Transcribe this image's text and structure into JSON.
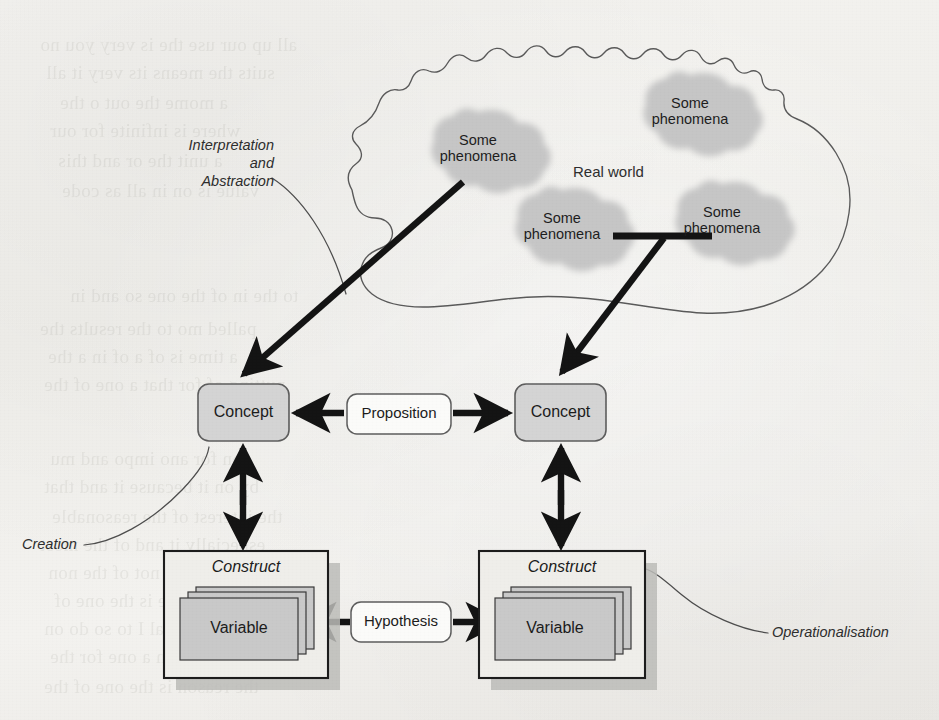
{
  "figure": {
    "kind": "conceptual-research-model-diagram",
    "real_world_label": "Real world",
    "phenomena_label": "Some\nphenomena",
    "phenomena": [
      {
        "id": "ph-top-right",
        "line1": "Some",
        "line2": "phenomena",
        "cx": 690,
        "cy": 113
      },
      {
        "id": "ph-left",
        "line1": "Some",
        "line2": "phenomena",
        "cx": 478,
        "cy": 150
      },
      {
        "id": "ph-bottom-left",
        "line1": "Some",
        "line2": "phenomena",
        "cx": 562,
        "cy": 228
      },
      {
        "id": "ph-bottom-right",
        "line1": "Some",
        "line2": "phenomena",
        "cx": 722,
        "cy": 222
      }
    ],
    "annotations": [
      {
        "id": "interpretation",
        "text": "Interpretation\nand\nAbstraction",
        "lines": [
          "Interpretation",
          "and",
          "Abstraction"
        ]
      },
      {
        "id": "creation",
        "text": "Creation"
      },
      {
        "id": "operationalisation",
        "text": "Operationalisation"
      }
    ],
    "nodes": [
      {
        "id": "concept-left",
        "label": "Concept",
        "type": "rounded-box",
        "x": 198,
        "y": 384,
        "w": 91,
        "h": 57
      },
      {
        "id": "concept-right",
        "label": "Concept",
        "type": "rounded-box",
        "x": 515,
        "y": 384,
        "w": 91,
        "h": 57
      },
      {
        "id": "proposition",
        "label": "Proposition",
        "type": "rounded-box-white",
        "x": 347,
        "y": 394,
        "w": 103,
        "h": 40
      },
      {
        "id": "construct-left",
        "label": "Construct",
        "type": "square-box",
        "x": 164,
        "y": 551,
        "w": 164,
        "h": 127
      },
      {
        "id": "construct-right",
        "label": "Construct",
        "type": "square-box",
        "x": 479,
        "y": 551,
        "w": 166,
        "h": 127
      },
      {
        "id": "variable-left",
        "label": "Variable",
        "type": "stacked-card",
        "x": 180,
        "y": 596,
        "w": 118,
        "h": 62
      },
      {
        "id": "variable-right",
        "label": "Variable",
        "type": "stacked-card",
        "x": 495,
        "y": 596,
        "w": 120,
        "h": 62
      },
      {
        "id": "hypothesis",
        "label": "Hypothesis",
        "type": "rounded-box-white",
        "x": 352,
        "y": 602,
        "w": 98,
        "h": 40
      }
    ],
    "edges": [
      {
        "id": "edge-phenomena-to-concept-left",
        "from": "ph-left",
        "to": "concept-left",
        "style": "thick-arrow",
        "direction": "one-way"
      },
      {
        "id": "edge-phenomena-to-concept-right",
        "from": "ph-bottom-right",
        "to": "concept-right",
        "style": "thick-arrow",
        "direction": "one-way"
      },
      {
        "id": "edge-concept-left-proposition",
        "from": "proposition",
        "to": "concept-left",
        "style": "thick-arrow",
        "direction": "one-way"
      },
      {
        "id": "edge-concept-right-proposition",
        "from": "proposition",
        "to": "concept-right",
        "style": "thick-arrow",
        "direction": "one-way"
      },
      {
        "id": "edge-concept-left-construct-left",
        "from": "concept-left",
        "to": "construct-left",
        "style": "thick-arrow",
        "direction": "two-way"
      },
      {
        "id": "edge-concept-right-construct-right",
        "from": "concept-right",
        "to": "construct-right",
        "style": "thick-arrow",
        "direction": "two-way"
      },
      {
        "id": "edge-variable-left-hypothesis",
        "from": "hypothesis",
        "to": "variable-left",
        "style": "thick-arrow",
        "direction": "one-way"
      },
      {
        "id": "edge-variable-right-hypothesis",
        "from": "hypothesis",
        "to": "variable-right",
        "style": "thick-arrow",
        "direction": "one-way"
      },
      {
        "id": "edge-phenomena-link",
        "from": "ph-bottom-left",
        "to": "ph-bottom-right",
        "style": "thick-bar",
        "direction": "none"
      },
      {
        "id": "leader-interpretation",
        "style": "thin-curve",
        "direction": "none"
      },
      {
        "id": "leader-creation",
        "style": "thin-curve",
        "direction": "none"
      },
      {
        "id": "leader-operationalisation",
        "style": "thin-curve",
        "direction": "none"
      }
    ],
    "colors": {
      "page_background": "#f1efec",
      "ink": "#1c1c1c",
      "thin_line": "#4a4a4a",
      "box_fill": "#cfcfcf",
      "box_fill_light": "#d6d6d6",
      "box_fill_white": "#fbfbfa",
      "blob_fill": "#c9c9c9",
      "shadow": "#b9b9b4"
    }
  },
  "ghost_text": [
    {
      "t": "all up our use the is very you no",
      "x": 40,
      "y": 34
    },
    {
      "t": "suits the means  its  very  it  all",
      "x": 46,
      "y": 62
    },
    {
      "t": "a  mome  the  out o  the",
      "x": 60,
      "y": 92
    },
    {
      "t": "where  is  infinite  for  our",
      "x": 50,
      "y": 120
    },
    {
      "t": "a  unit  the  or  and  this",
      "x": 58,
      "y": 150
    },
    {
      "t": "value  is  on  in  all  as  code",
      "x": 62,
      "y": 180
    },
    {
      "t": "to the in of the one so and in",
      "x": 70,
      "y": 285
    },
    {
      "t": "palled  mo  to  the  results  the",
      "x": 40,
      "y": 318
    },
    {
      "t": "a  time  is  of  a  of  in  a  the",
      "x": 48,
      "y": 346
    },
    {
      "t": "putting  of  for  that  a  one of the",
      "x": 44,
      "y": 374
    },
    {
      "t": "con  for  ano  impo  and  mu",
      "x": 50,
      "y": 448
    },
    {
      "t": "by  on  it  because  it  and  that",
      "x": 44,
      "y": 476
    },
    {
      "t": "the  interest  of  the  reasonable",
      "x": 52,
      "y": 506
    },
    {
      "t": "especially  it  and  of  the  most",
      "x": 40,
      "y": 534
    },
    {
      "t": "they  did  not  of  the  non",
      "x": 48,
      "y": 562
    },
    {
      "t": "to  the  one  is  the  one  of",
      "x": 54,
      "y": 590
    },
    {
      "t": "so  usual  I  to  so  do  on",
      "x": 44,
      "y": 618
    },
    {
      "t": "between  a  one  for  the",
      "x": 50,
      "y": 646
    },
    {
      "t": "the  reason  is  the  one  of  the",
      "x": 44,
      "y": 676
    }
  ]
}
